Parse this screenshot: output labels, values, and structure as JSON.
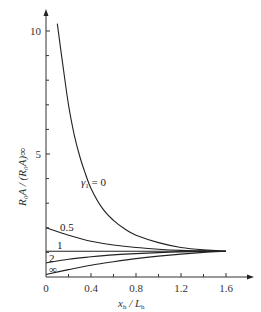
{
  "chart_data": {
    "type": "line",
    "title": "",
    "xlabel": "x_h / L_h",
    "ylabel": "R_0 A / (R_0 A)_∞",
    "xlim": [
      0,
      1.7
    ],
    "ylim": [
      0,
      10.7
    ],
    "x_ticks": [
      0,
      0.4,
      0.8,
      1.2,
      1.6
    ],
    "x_tick_labels": [
      "0",
      "0.4",
      "0.8",
      "1.2",
      "1.6"
    ],
    "x_minor_ticks": [
      0.2,
      0.6,
      1.0,
      1.4
    ],
    "y_ticks": [
      5,
      10
    ],
    "y_tick_labels": [
      "5",
      "10"
    ],
    "y_minor_ticks": [
      1,
      2,
      3,
      4,
      6,
      7,
      8,
      9
    ],
    "grid": false,
    "legend": "inline curve labels",
    "parameter_name": "γ₁",
    "series": [
      {
        "name": "γ₁ = 0",
        "label": "γ₁ = 0",
        "x": [
          0.1,
          0.15,
          0.2,
          0.25,
          0.3,
          0.35,
          0.4,
          0.5,
          0.6,
          0.7,
          0.8,
          1.0,
          1.2,
          1.4,
          1.6
        ],
        "y": [
          10.3,
          8.6,
          7.0,
          5.8,
          4.9,
          4.2,
          3.6,
          2.8,
          2.3,
          1.95,
          1.7,
          1.4,
          1.2,
          1.1,
          1.05
        ]
      },
      {
        "name": "γ₁ = 0.5",
        "label": "0.5",
        "x": [
          0,
          0.2,
          0.4,
          0.6,
          0.8,
          1.0,
          1.2,
          1.4,
          1.6
        ],
        "y": [
          2.0,
          1.7,
          1.45,
          1.3,
          1.2,
          1.13,
          1.08,
          1.06,
          1.05
        ]
      },
      {
        "name": "γ₁ = 1",
        "label": "1",
        "x": [
          0,
          0.4,
          0.8,
          1.2,
          1.6
        ],
        "y": [
          1.05,
          1.05,
          1.05,
          1.05,
          1.05
        ]
      },
      {
        "name": "γ₁ = 2",
        "label": "2",
        "x": [
          0,
          0.2,
          0.4,
          0.6,
          0.8,
          1.0,
          1.2,
          1.4,
          1.6
        ],
        "y": [
          0.57,
          0.72,
          0.82,
          0.9,
          0.95,
          0.99,
          1.02,
          1.04,
          1.05
        ]
      },
      {
        "name": "γ₁ = ∞",
        "label": "∞",
        "x": [
          0,
          0.2,
          0.4,
          0.6,
          0.8,
          1.0,
          1.2,
          1.4,
          1.6
        ],
        "y": [
          0.1,
          0.3,
          0.48,
          0.62,
          0.75,
          0.85,
          0.93,
          1.0,
          1.05
        ]
      }
    ]
  },
  "labels": {
    "x_axis_main": "x",
    "x_axis_sub": "h",
    "x_axis_sep": " / L",
    "x_axis_sub2": "h",
    "y_axis_text": "R₀A / (R₀A)∞",
    "gamma_label_main": "γ",
    "gamma_label_sub": "1",
    "gamma_label_eq": " = 0",
    "curve_05": "0.5",
    "curve_1": "1",
    "curve_2": "2",
    "curve_inf": "∞",
    "tick_y_10": "10",
    "tick_y_5": "5",
    "tick_x_0": "0",
    "tick_x_04": "0.4",
    "tick_x_08": "0.8",
    "tick_x_12": "1.2",
    "tick_x_16": "1.6"
  }
}
